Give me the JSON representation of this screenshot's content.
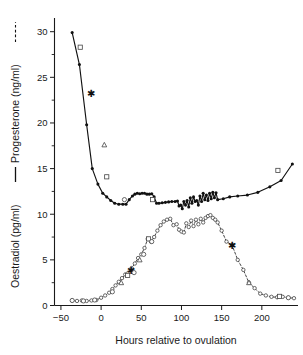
{
  "chart_data": {
    "type": "line",
    "title": "",
    "xlabel": "Hours relative to ovulation",
    "ylabel_left_part1": "Oestradiol (pg/ml)",
    "ylabel_left_part2": "Progesterone (ng/ml)",
    "ylabel_full": "Oestradiol (pg/ml) — Progesterone (ng/ml) - - - -",
    "xlim": [
      -58,
      245
    ],
    "ylim": [
      0,
      31.5
    ],
    "xticks": [
      -50,
      0,
      50,
      100,
      150,
      200
    ],
    "xticklabels": [
      "−50",
      "0",
      "50",
      "100",
      "150",
      "200"
    ],
    "yticks": [
      0,
      5,
      10,
      15,
      20,
      25,
      30
    ],
    "yticklabels": [
      "0",
      "5",
      "10",
      "15",
      "20",
      "25",
      "30"
    ],
    "yticks_minor": [
      2.5,
      7.5,
      12.5,
      17.5,
      22.5,
      27.5
    ],
    "grid": false,
    "legend_position": "y-axis-label",
    "series": [
      {
        "name": "Progesterone (ng/ml)",
        "linestyle": "solid",
        "marker": "filled-circle",
        "color": "#111111",
        "x": [
          -36,
          -27,
          -18,
          -11,
          -4,
          2,
          7,
          12,
          17,
          22,
          27,
          31,
          35,
          39,
          42,
          45,
          48,
          51,
          54,
          57,
          60,
          63,
          66,
          69,
          72,
          76,
          80,
          84,
          88,
          92,
          95,
          97,
          99,
          101,
          103,
          105,
          107,
          109,
          111,
          113,
          115,
          117,
          119,
          121,
          123,
          125,
          127,
          129,
          131,
          133,
          135,
          137,
          139,
          141,
          143,
          145,
          152,
          160,
          170,
          182,
          195,
          210,
          224,
          238
        ],
        "y": [
          29.9,
          26.4,
          19.8,
          15.0,
          13.3,
          12.3,
          11.9,
          11.5,
          11.2,
          11.1,
          11.1,
          11.1,
          11.6,
          12.0,
          12.2,
          12.3,
          12.25,
          12.3,
          12.3,
          12.2,
          12.2,
          12.25,
          11.9,
          11.2,
          11.2,
          11.25,
          11.3,
          11.35,
          11.4,
          11.4,
          11.45,
          10.9,
          11.0,
          10.6,
          11.4,
          11.0,
          11.5,
          10.8,
          11.8,
          11.2,
          11.9,
          11.4,
          11.5,
          11.0,
          12.0,
          11.4,
          12.3,
          11.6,
          12.1,
          11.5,
          12.3,
          11.7,
          12.4,
          11.8,
          12.35,
          11.6,
          11.7,
          11.9,
          12.0,
          12.1,
          12.4,
          13.0,
          13.7,
          15.5
        ]
      },
      {
        "name": "Oestradiol (pg/ml)",
        "linestyle": "dashed",
        "marker": "open-circle",
        "color": "#3a3a3a",
        "x": [
          -36,
          -30,
          -24,
          -18,
          -12,
          -6,
          0,
          5,
          10,
          14,
          18,
          22,
          26,
          30,
          34,
          38,
          42,
          46,
          50,
          54,
          58,
          62,
          66,
          70,
          74,
          78,
          82,
          86,
          90,
          94,
          97,
          100,
          103,
          106,
          109,
          112,
          115,
          118,
          121,
          124,
          127,
          130,
          133,
          136,
          139,
          142,
          145,
          150,
          156,
          163,
          170,
          177,
          184,
          191,
          198,
          205,
          212,
          219,
          226,
          233,
          240
        ],
        "y": [
          0.55,
          0.5,
          0.55,
          0.5,
          0.55,
          0.6,
          0.85,
          1.1,
          1.4,
          1.8,
          2.2,
          2.6,
          3.0,
          3.4,
          3.6,
          4.1,
          4.6,
          5.2,
          5.6,
          6.3,
          7.3,
          7.0,
          7.5,
          8.2,
          8.8,
          9.2,
          9.4,
          9.5,
          8.8,
          8.9,
          8.3,
          8.1,
          8.0,
          9.0,
          8.6,
          9.3,
          8.7,
          9.4,
          8.9,
          9.5,
          9.1,
          9.6,
          9.8,
          9.9,
          9.6,
          9.4,
          9.1,
          8.2,
          7.0,
          6.6,
          5.0,
          3.9,
          2.5,
          1.9,
          1.3,
          1.1,
          0.95,
          0.9,
          0.95,
          0.85,
          0.8
        ]
      }
    ],
    "extra_markers": [
      {
        "shape": "square",
        "x": -26,
        "y": 28.3
      },
      {
        "shape": "star",
        "x": -12,
        "y": 23.2
      },
      {
        "shape": "triangle",
        "x": 4,
        "y": 17.6
      },
      {
        "shape": "square",
        "x": 7,
        "y": 14.1
      },
      {
        "shape": "circle",
        "x": 29,
        "y": 11.6
      },
      {
        "shape": "square",
        "x": 64,
        "y": 11.6
      },
      {
        "shape": "square",
        "x": 220,
        "y": 14.8
      },
      {
        "shape": "circle",
        "x": -36,
        "y": 0.55
      },
      {
        "shape": "circle",
        "x": -22,
        "y": 0.5
      },
      {
        "shape": "circle",
        "x": -8,
        "y": 0.6
      },
      {
        "shape": "circle",
        "x": 14,
        "y": 1.5
      },
      {
        "shape": "triangle",
        "x": 25,
        "y": 2.5
      },
      {
        "shape": "square",
        "x": 33,
        "y": 3.3
      },
      {
        "shape": "star",
        "x": 37,
        "y": 3.9
      },
      {
        "shape": "circle",
        "x": 41,
        "y": 3.6
      },
      {
        "shape": "triangle",
        "x": 48,
        "y": 5.0
      },
      {
        "shape": "circle",
        "x": 53,
        "y": 5.6
      },
      {
        "shape": "square",
        "x": 59,
        "y": 7.3
      },
      {
        "shape": "circle",
        "x": 63,
        "y": 7.0
      },
      {
        "shape": "triangle",
        "x": 184,
        "y": 2.5
      },
      {
        "shape": "star",
        "x": 163,
        "y": 6.6
      },
      {
        "shape": "square",
        "x": 222,
        "y": 1.0
      },
      {
        "shape": "circle",
        "x": 233,
        "y": 0.85
      }
    ]
  }
}
